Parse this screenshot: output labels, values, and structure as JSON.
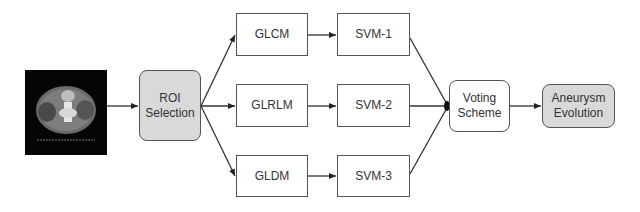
{
  "diagram": {
    "input_image": {
      "description": "axial CT scan slice of abdomen"
    },
    "roi": {
      "label": "ROI\nSelection"
    },
    "features": [
      {
        "label": "GLCM"
      },
      {
        "label": "GLRLM"
      },
      {
        "label": "GLDM"
      }
    ],
    "classifiers": [
      {
        "label": "SVM-1"
      },
      {
        "label": "SVM-2"
      },
      {
        "label": "SVM-3"
      }
    ],
    "voting": {
      "label": "Voting\nScheme"
    },
    "output": {
      "label": "Aneurysm\nEvolution"
    },
    "colors": {
      "stroke": "#555555",
      "shaded_fill": "#d9d9d9",
      "text": "#333333"
    }
  }
}
